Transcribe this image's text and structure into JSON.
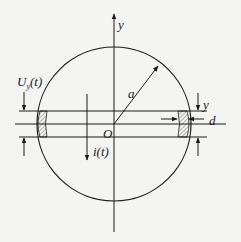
{
  "diagram": {
    "type": "circular-cross-section-with-slab",
    "colors": {
      "background": "#f4f4f2",
      "stroke": "#1a1a1a",
      "hatch": "#444444"
    },
    "circle": {
      "cx": 114,
      "cy": 124,
      "r": 77
    },
    "labels": {
      "y_axis": "y",
      "radius": "a",
      "origin": "O",
      "current": "i(t)",
      "voltage_main": "U",
      "voltage_sub": "y",
      "voltage_arg": "(t)",
      "dim_y": "y",
      "dim_d": "d"
    }
  }
}
